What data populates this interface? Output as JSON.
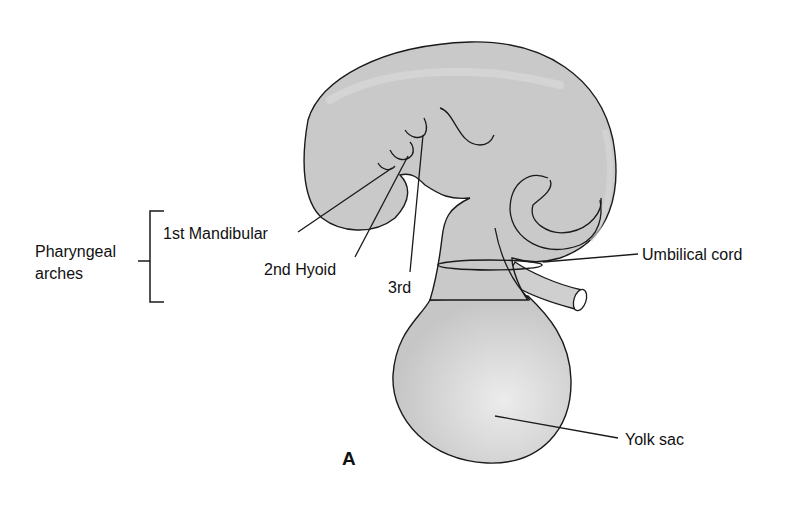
{
  "figure": {
    "panel_label": "A",
    "group_label": {
      "line1": "Pharyngeal",
      "line2": "arches"
    },
    "labels": {
      "mandibular": "1st Mandibular",
      "hyoid": "2nd Hyoid",
      "third": "3rd",
      "umbilical_cord": "Umbilical cord",
      "yolk_sac": "Yolk sac"
    },
    "colors": {
      "fill": "#c9c9c9",
      "stroke": "#1a1a1a",
      "background": "#ffffff"
    }
  }
}
